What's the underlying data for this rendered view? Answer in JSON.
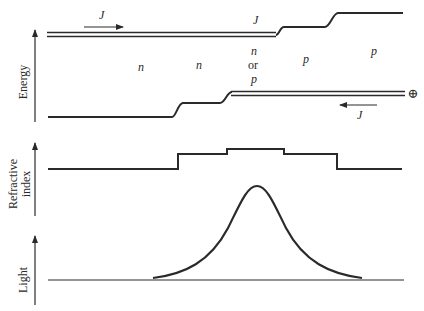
{
  "figure": {
    "panels": [
      {
        "id": "energy",
        "axis_label": "Energy"
      },
      {
        "id": "refractive",
        "axis_label_line1": "Refractive",
        "axis_label_line2": "index"
      },
      {
        "id": "light",
        "axis_label": "Light"
      }
    ],
    "energy_labels": {
      "current_top": "J",
      "current_mid": "J",
      "current_bottom": "J",
      "region1": "n",
      "region2": "n",
      "region3_line1": "n",
      "region3_line2": "or",
      "region3_line3": "p",
      "region4": "p",
      "region5": "p",
      "hole_symbol": "⊕"
    },
    "colors": {
      "line": "#2a2a2a",
      "background": "#ffffff"
    }
  }
}
